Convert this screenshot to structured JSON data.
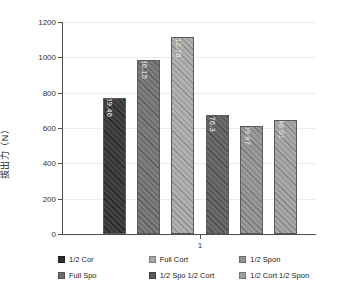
{
  "chart_data": {
    "type": "bar",
    "title": "",
    "xlabel": "",
    "ylabel": "拔出力（N）",
    "categories": [
      "1"
    ],
    "xticklabels": [
      "1"
    ],
    "ylim": [
      0,
      1200
    ],
    "yticks": [
      0,
      200,
      400,
      600,
      800,
      1000,
      1200
    ],
    "yticklabels": [
      "0",
      "200",
      "400",
      "600",
      "800",
      "1000",
      "1200"
    ],
    "grid": true,
    "legend_position": "bottom",
    "series": [
      {
        "name": "1/2 Cor",
        "values": [
          769.46
        ],
        "label": "769.46",
        "color": "#2e2e2e"
      },
      {
        "name": "Full Spo",
        "values": [
          986.15
        ],
        "label": "986.15",
        "color": "#6e6e6e"
      },
      {
        "name": "Full Cort",
        "values": [
          1112.76
        ],
        "label": "1112.76",
        "color": "#a8a8a8"
      },
      {
        "name": "1/2 Spo 1/2 Cort",
        "values": [
          676.3
        ],
        "label": "676.3",
        "color": "#5a5a5a"
      },
      {
        "name": "1/2 Spon",
        "values": [
          609.87
        ],
        "label": "609.87",
        "color": "#8f8f8f"
      },
      {
        "name": "1/2 Cort 1/2 Spon",
        "values": [
          648.01
        ],
        "label": "648.01",
        "color": "#9e9e9e"
      }
    ]
  },
  "legend": {
    "entries": [
      {
        "label": "1/2 Cor",
        "color": "#2e2e2e"
      },
      {
        "label": "Full Cort",
        "color": "#a8a8a8"
      },
      {
        "label": "1/2 Spon",
        "color": "#8f8f8f"
      },
      {
        "label": "Full Spo",
        "color": "#6e6e6e"
      },
      {
        "label": "1/2 Spo 1/2 Cort",
        "color": "#5a5a5a"
      },
      {
        "label": "1/2 Cort 1/2 Spon",
        "color": "#9e9e9e"
      }
    ]
  }
}
